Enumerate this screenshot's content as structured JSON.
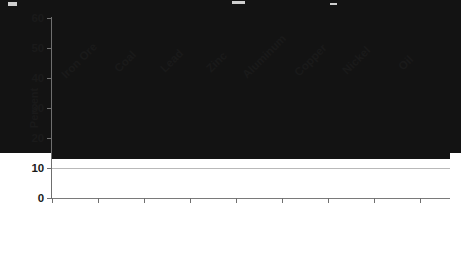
{
  "chart_data": {
    "type": "bar",
    "title": "",
    "subtitle": "",
    "xlabel": "",
    "ylabel": "Percent",
    "ylim": [
      0,
      60
    ],
    "ytick_values": [
      0,
      10,
      20,
      30,
      40,
      50,
      60
    ],
    "ytick_labels": [
      "0",
      "10",
      "20",
      "30",
      "40",
      "50",
      "60"
    ],
    "grid": true,
    "legend": false,
    "bar_color": "#131313",
    "categories": [
      "Iron Ore",
      "Coal",
      "Lead",
      "Zinc",
      "Aluminum",
      "Copper",
      "Nickel",
      "Oil"
    ],
    "values": [
      51,
      47,
      43.5,
      42,
      39.5,
      38.5,
      36,
      10
    ],
    "series": [
      {
        "name": "Percent",
        "values": [
          51,
          47,
          43.5,
          42,
          39.5,
          38.5,
          36,
          10
        ]
      }
    ]
  },
  "axes": {
    "y_axis_title": "Percent",
    "axis_color": "#6f6f6f",
    "gridline_color": "#b9b9b9"
  }
}
